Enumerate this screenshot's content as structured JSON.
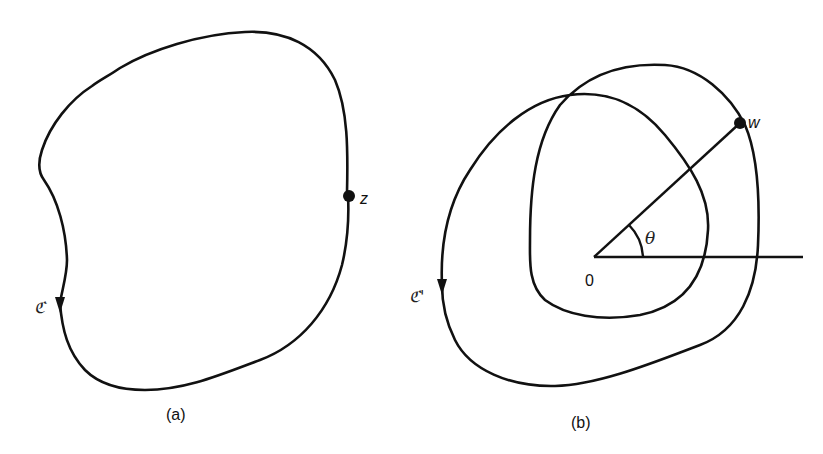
{
  "figure": {
    "panel_a": {
      "caption": "(a)",
      "curve_label": "ℭ",
      "point_label": "z"
    },
    "panel_b": {
      "caption": "(b)",
      "curve_label": "ℭ'",
      "point_label": "w",
      "origin_label": "0",
      "angle_label": "θ"
    },
    "colors": {
      "stroke": "#111111",
      "background": "#ffffff"
    }
  }
}
